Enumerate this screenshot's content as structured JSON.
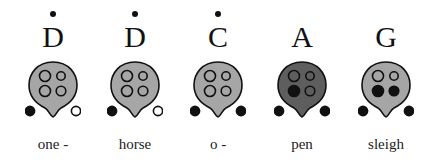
{
  "colors": {
    "body_light": "#a6a6a6",
    "body_dark": "#5e5e5e",
    "outline": "#111111",
    "hole_covered": "#111111",
    "hole_open_fill_light": "#a6a6a6",
    "hole_open_thumb": "#ffffff"
  },
  "notes": [
    {
      "note": "D",
      "octave_dot": true,
      "lyric": "one -",
      "shade": "light",
      "holes": {
        "top_left": "open",
        "top_right": "open",
        "bottom_left": "open",
        "bottom_right": "open",
        "thumb_left": "covered",
        "thumb_right": "open"
      }
    },
    {
      "note": "D",
      "octave_dot": true,
      "lyric": "horse",
      "shade": "light",
      "holes": {
        "top_left": "open",
        "top_right": "open",
        "bottom_left": "open",
        "bottom_right": "open",
        "thumb_left": "covered",
        "thumb_right": "open"
      }
    },
    {
      "note": "C",
      "octave_dot": true,
      "lyric": "o -",
      "shade": "light",
      "holes": {
        "top_left": "open",
        "top_right": "open",
        "bottom_left": "open",
        "bottom_right": "open",
        "thumb_left": "covered",
        "thumb_right": "covered"
      }
    },
    {
      "note": "A",
      "octave_dot": false,
      "lyric": "pen",
      "shade": "dark",
      "holes": {
        "top_left": "open",
        "top_right": "open",
        "bottom_left": "covered",
        "bottom_right": "open",
        "thumb_left": "covered",
        "thumb_right": "covered"
      }
    },
    {
      "note": "G",
      "octave_dot": false,
      "lyric": "sleigh",
      "shade": "light",
      "holes": {
        "top_left": "open",
        "top_right": "open",
        "bottom_left": "covered",
        "bottom_right": "covered",
        "thumb_left": "covered",
        "thumb_right": "covered"
      }
    }
  ]
}
